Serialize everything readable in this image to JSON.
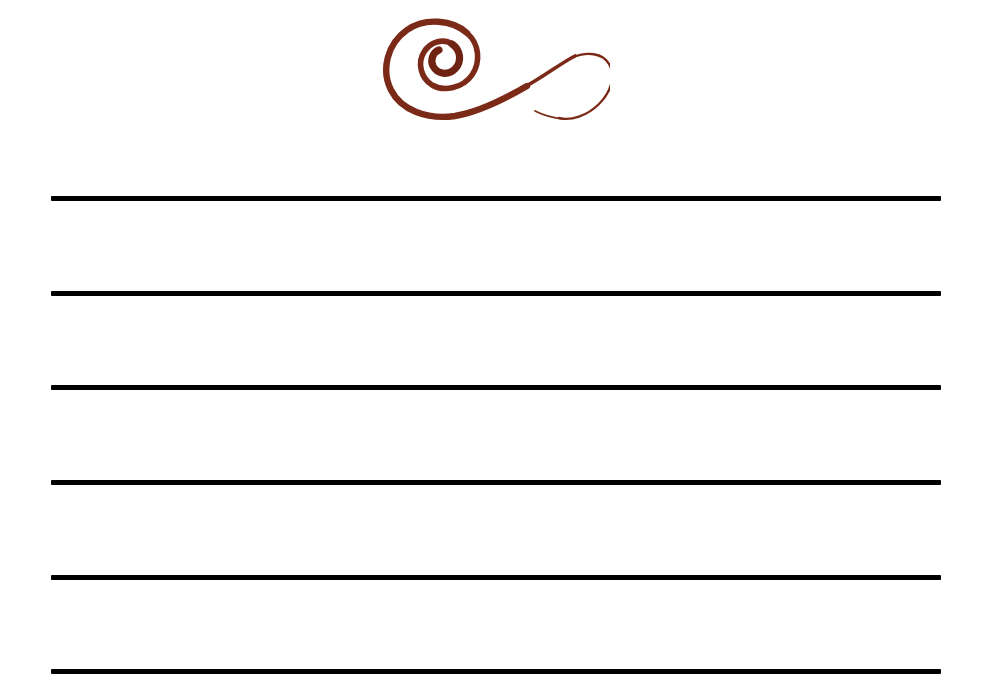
{
  "page": {
    "name": "lined-stationery-sheet",
    "width": 989,
    "height": 675,
    "background_color": "#ffffff"
  },
  "ornament": {
    "name": "calligraphic-flourish-icon",
    "type": "decorative-swirl",
    "color": "#7B2A18",
    "secondary_color": "#6E2313",
    "left": 375,
    "top": 8,
    "width": 235,
    "height": 122,
    "shape": "spiral-with-trailing-s-curve-hook"
  },
  "rules": {
    "name": "ruling-lines",
    "color": "#000000",
    "left": 51,
    "width": 890,
    "thickness": 5,
    "count": 6,
    "spacing": 94.5,
    "lines": [
      {
        "label": "line-1",
        "y": 196
      },
      {
        "label": "line-2",
        "y": 291
      },
      {
        "label": "line-3",
        "y": 385
      },
      {
        "label": "line-4",
        "y": 480
      },
      {
        "label": "line-5",
        "y": 575
      },
      {
        "label": "line-6",
        "y": 669
      }
    ]
  },
  "text_content": {
    "body": ""
  }
}
